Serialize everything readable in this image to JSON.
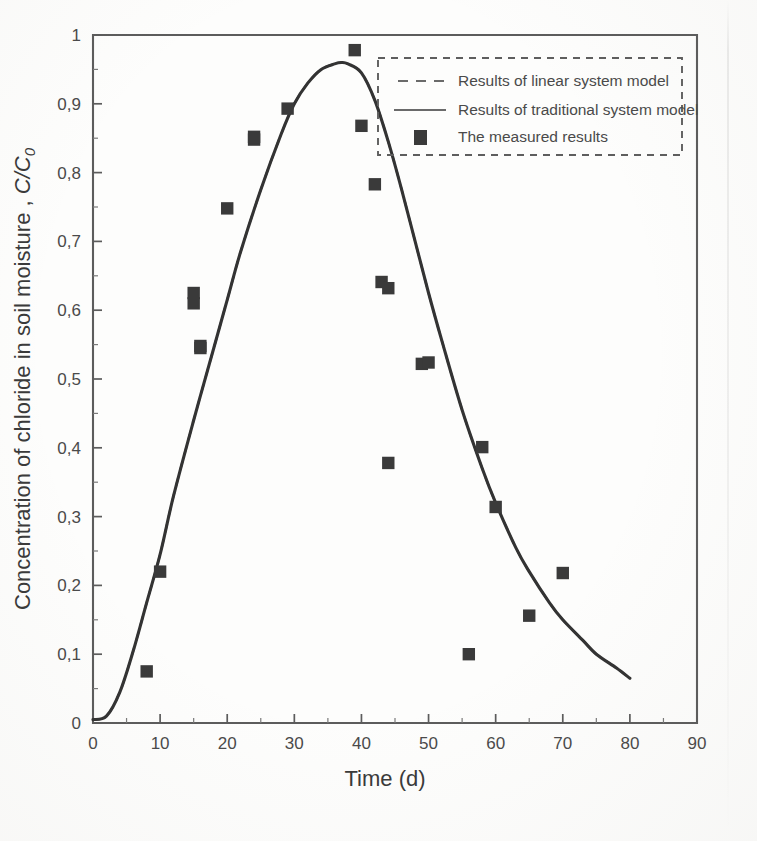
{
  "figure": {
    "background_color": "#fdfdfc",
    "ink_color": "#3a3a3a"
  },
  "axes": {
    "x": {
      "title": "Time (d)",
      "min": 0,
      "max": 90,
      "tick_step": 10,
      "tick_labels": [
        "0",
        "10",
        "20",
        "30",
        "40",
        "50",
        "60",
        "70",
        "80",
        "90"
      ],
      "tick_values": [
        0,
        10,
        20,
        30,
        40,
        50,
        60,
        70,
        80,
        90
      ]
    },
    "y": {
      "title_main": "Concentration of chloride in soil moisture ,",
      "title_symbol": "C/C",
      "title_subscript": "0",
      "min": 0,
      "max": 1,
      "tick_step": 0.1,
      "tick_labels": [
        "0",
        "0,1",
        "0,2",
        "0,3",
        "0,4",
        "0,5",
        "0,6",
        "0,7",
        "0,8",
        "0,9",
        "1"
      ],
      "tick_values": [
        0,
        0.1,
        0.2,
        0.3,
        0.4,
        0.5,
        0.6,
        0.7,
        0.8,
        0.9,
        1
      ]
    }
  },
  "legend": {
    "position": "top-right-inside",
    "border_style": "dashed",
    "entries": [
      {
        "label": "Results of linear system model",
        "marker": "dashed-line",
        "color": "#6a6a6a"
      },
      {
        "label": "Results of traditional system model",
        "marker": "solid-line",
        "color": "#6a6a6a"
      },
      {
        "label": "The measured results",
        "marker": "filled-square",
        "color": "#3a3a3a"
      }
    ]
  },
  "chart_data": {
    "type": "line",
    "title": "",
    "xlabel": "Time (d)",
    "ylabel": "Concentration of chloride in soil moisture , C/C0",
    "xlim": [
      0,
      90
    ],
    "ylim": [
      0,
      1
    ],
    "grid": false,
    "legend_position": "top-right-inside",
    "series": [
      {
        "name": "Results of linear system model",
        "type": "line",
        "style": "dashed",
        "color": "#4a4a4a",
        "x": [
          0,
          2,
          4,
          6,
          8,
          10,
          12,
          15,
          18,
          20,
          22,
          25,
          28,
          30,
          32,
          34,
          36,
          37,
          38,
          40,
          42,
          44,
          46,
          48,
          50,
          52,
          55,
          58,
          60,
          63,
          65,
          68,
          70,
          73,
          75,
          78,
          80
        ],
        "y": [
          0.005,
          0.01,
          0.045,
          0.105,
          0.175,
          0.245,
          0.33,
          0.44,
          0.545,
          0.615,
          0.685,
          0.775,
          0.855,
          0.9,
          0.93,
          0.95,
          0.958,
          0.96,
          0.958,
          0.945,
          0.905,
          0.845,
          0.775,
          0.7,
          0.625,
          0.555,
          0.455,
          0.37,
          0.32,
          0.255,
          0.22,
          0.175,
          0.15,
          0.12,
          0.1,
          0.08,
          0.065
        ]
      },
      {
        "name": "Results of traditional system model",
        "type": "line",
        "style": "solid",
        "color": "#333333",
        "x": [
          0,
          2,
          4,
          6,
          8,
          10,
          12,
          15,
          18,
          20,
          22,
          25,
          28,
          30,
          32,
          34,
          36,
          37,
          38,
          40,
          42,
          44,
          46,
          48,
          50,
          52,
          55,
          58,
          60,
          63,
          65,
          68,
          70,
          73,
          75,
          78,
          80
        ],
        "y": [
          0.005,
          0.01,
          0.045,
          0.105,
          0.175,
          0.245,
          0.33,
          0.44,
          0.545,
          0.615,
          0.685,
          0.775,
          0.855,
          0.9,
          0.93,
          0.95,
          0.958,
          0.96,
          0.958,
          0.945,
          0.905,
          0.845,
          0.775,
          0.7,
          0.625,
          0.555,
          0.455,
          0.37,
          0.32,
          0.255,
          0.22,
          0.175,
          0.15,
          0.12,
          0.1,
          0.08,
          0.065
        ]
      },
      {
        "name": "The measured results",
        "type": "scatter",
        "marker": "filled-square",
        "color": "#3a3a3a",
        "points": [
          {
            "x": 8,
            "y": 0.075
          },
          {
            "x": 10,
            "y": 0.22
          },
          {
            "x": 15,
            "y": 0.625
          },
          {
            "x": 15,
            "y": 0.61
          },
          {
            "x": 16,
            "y": 0.548
          },
          {
            "x": 16,
            "y": 0.545
          },
          {
            "x": 20,
            "y": 0.748
          },
          {
            "x": 24,
            "y": 0.848
          },
          {
            "x": 24,
            "y": 0.852
          },
          {
            "x": 29,
            "y": 0.893
          },
          {
            "x": 39,
            "y": 0.978
          },
          {
            "x": 40,
            "y": 0.868
          },
          {
            "x": 42,
            "y": 0.783
          },
          {
            "x": 43,
            "y": 0.641
          },
          {
            "x": 44,
            "y": 0.632
          },
          {
            "x": 44,
            "y": 0.378
          },
          {
            "x": 49,
            "y": 0.522
          },
          {
            "x": 50,
            "y": 0.524
          },
          {
            "x": 56,
            "y": 0.1
          },
          {
            "x": 58,
            "y": 0.401
          },
          {
            "x": 60,
            "y": 0.314
          },
          {
            "x": 65,
            "y": 0.156
          },
          {
            "x": 70,
            "y": 0.218
          }
        ]
      }
    ]
  }
}
